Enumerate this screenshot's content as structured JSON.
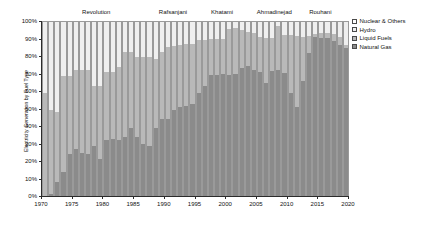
{
  "chart_data": {
    "type": "bar",
    "stacked": true,
    "normalized": true,
    "title": "",
    "xlabel": "",
    "ylabel": "Electricity Generation by Fuel Type",
    "ylim": [
      0,
      100
    ],
    "xlim": [
      1970,
      2020
    ],
    "grid": false,
    "legend_position": "right",
    "y_tick_labels": [
      "0%",
      "10%",
      "20%",
      "30%",
      "40%",
      "50%",
      "60%",
      "70%",
      "80%",
      "90%",
      "100%"
    ],
    "y_tick_values": [
      0,
      10,
      20,
      30,
      40,
      50,
      60,
      70,
      80,
      90,
      100
    ],
    "x_tick_labels": [
      "1970",
      "1975",
      "1980",
      "1985",
      "1990",
      "1995",
      "2000",
      "2005",
      "2010",
      "2015",
      "2020"
    ],
    "x_tick_values": [
      1970,
      1975,
      1980,
      1985,
      1990,
      1995,
      2000,
      2005,
      2010,
      2015,
      2020
    ],
    "categories": [
      1970,
      1971,
      1972,
      1973,
      1974,
      1975,
      1976,
      1977,
      1978,
      1979,
      1980,
      1981,
      1982,
      1983,
      1984,
      1985,
      1986,
      1987,
      1988,
      1989,
      1990,
      1991,
      1992,
      1993,
      1994,
      1995,
      1996,
      1997,
      1998,
      1999,
      2000,
      2001,
      2002,
      2003,
      2004,
      2005,
      2006,
      2007,
      2008,
      2009,
      2010,
      2011,
      2012,
      2013,
      2014,
      2015,
      2016,
      2017,
      2018,
      2019
    ],
    "series": [
      {
        "name": "Natural Gas",
        "color": "#8b8b8b",
        "values": [
          0,
          1,
          8,
          14,
          24,
          27,
          25,
          24,
          29,
          21,
          32,
          32.5,
          32,
          34,
          39,
          34,
          30,
          29,
          39,
          44,
          44,
          49.5,
          51,
          52,
          53,
          59,
          63,
          69.5,
          69.5,
          70,
          69.5,
          70,
          73.5,
          74.5,
          72.5,
          71,
          65,
          72,
          72.5,
          70.5,
          59,
          51,
          66,
          82,
          91.5,
          91,
          91,
          89,
          87,
          85
        ]
      },
      {
        "name": "Liquid Fuels",
        "color": "#b9b9b9",
        "values": [
          59,
          48.5,
          40,
          55,
          45,
          45.5,
          47.5,
          48.5,
          34.5,
          42.5,
          39,
          38.5,
          42,
          48.5,
          44,
          46,
          50,
          51,
          40,
          38.5,
          41.5,
          37,
          36,
          35.5,
          34.5,
          30.5,
          26.5,
          20.5,
          20.5,
          20,
          26.5,
          26.5,
          22,
          20,
          21,
          20.5,
          26,
          19,
          25,
          22,
          33.5,
          41,
          25.5,
          10,
          1.5,
          2.5,
          2.5,
          4,
          4.5,
          2
        ]
      },
      {
        "name": "Hydro",
        "color": "#efefef",
        "values": [
          41,
          50.5,
          52,
          31,
          31,
          27.5,
          27.5,
          27.5,
          36.5,
          36.5,
          29,
          29,
          26,
          17.5,
          17,
          20,
          20,
          20,
          21,
          17.5,
          14.5,
          13.5,
          13,
          12.5,
          12.5,
          10.5,
          10.5,
          10,
          10,
          10,
          4,
          3.5,
          4.5,
          5.5,
          6.5,
          8.5,
          9,
          9,
          2.5,
          7.5,
          7.5,
          8,
          8.5,
          8,
          7,
          6.5,
          6.5,
          7,
          8.5,
          13
        ]
      },
      {
        "name": "Nuclear & Others",
        "color": "#ffffff",
        "values": [
          0,
          0,
          0,
          0,
          0,
          0,
          0,
          0,
          0,
          0,
          0,
          0,
          0,
          0,
          0,
          0,
          0,
          0,
          0,
          0,
          0,
          0,
          0,
          0,
          0,
          0,
          0,
          0,
          0,
          0,
          0,
          0,
          0,
          0,
          0,
          0,
          0,
          0,
          0,
          0,
          0,
          0,
          0,
          0,
          0,
          0,
          0,
          0,
          0,
          0
        ]
      }
    ],
    "legend_entries": [
      {
        "label": "Nuclear & Others",
        "color": "#ffffff"
      },
      {
        "label": "Hydro",
        "color": "#efefef"
      },
      {
        "label": "Liquid Fuels",
        "color": "#b9b9b9"
      },
      {
        "label": "Natural Gas",
        "color": "#8b8b8b"
      }
    ],
    "annotations": [
      {
        "label": "Revolution",
        "x": 1979
      },
      {
        "label": "Rafsanjani",
        "x": 1991.5
      },
      {
        "label": "Khatami",
        "x": 1999.5
      },
      {
        "label": "Ahmadinejad",
        "x": 2008
      },
      {
        "label": "Rouhani",
        "x": 2015.5
      }
    ]
  },
  "axis_color": "#2b2b2b",
  "bar_edge_color": "#9a9a9a"
}
